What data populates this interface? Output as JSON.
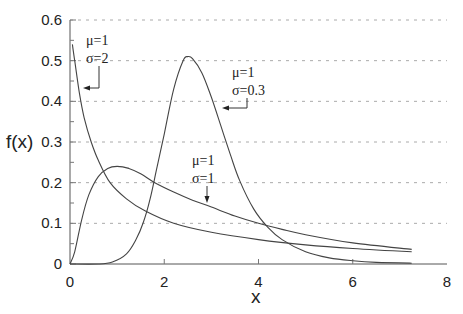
{
  "chart_data": {
    "type": "line",
    "title": "",
    "xlabel": "x",
    "ylabel": "f(x)",
    "xlim": [
      0,
      8
    ],
    "ylim": [
      0,
      0.6
    ],
    "x_ticks": [
      "0",
      "2",
      "4",
      "6",
      "8"
    ],
    "y_ticks": [
      "0",
      "0.1",
      "0.2",
      "0.3",
      "0.4",
      "0.5",
      "0.6"
    ],
    "grid": "horizontal dashed at 0.1 intervals",
    "legend": "none (inline annotations with arrows)",
    "series": [
      {
        "name": "mu=1 sigma=2",
        "annotation": [
          "μ=1",
          "σ=2"
        ],
        "x": [
          0.05,
          0.1,
          0.2,
          0.3,
          0.45,
          0.6,
          0.85,
          1.2,
          1.6,
          2.2,
          3.0,
          4.0,
          5.0,
          6.0,
          7.25
        ],
        "y": [
          0.54,
          0.5,
          0.42,
          0.36,
          0.3,
          0.255,
          0.2,
          0.16,
          0.13,
          0.1,
          0.078,
          0.06,
          0.047,
          0.038,
          0.03
        ]
      },
      {
        "name": "mu=1 sigma=1",
        "annotation": [
          "μ=1",
          "σ=1"
        ],
        "x": [
          0,
          0.1,
          0.25,
          0.4,
          0.6,
          0.8,
          1.0,
          1.25,
          1.5,
          1.8,
          2.2,
          2.6,
          3.0,
          3.5,
          4.0,
          4.5,
          5.0,
          6.0,
          7.25
        ],
        "y": [
          0,
          0.03,
          0.11,
          0.17,
          0.215,
          0.235,
          0.24,
          0.235,
          0.222,
          0.2,
          0.177,
          0.157,
          0.14,
          0.118,
          0.1,
          0.085,
          0.072,
          0.052,
          0.036
        ]
      },
      {
        "name": "mu=1 sigma=0.3",
        "annotation": [
          "μ=1",
          "σ=0.3"
        ],
        "x": [
          0,
          0.6,
          0.9,
          1.2,
          1.4,
          1.55,
          1.7,
          1.85,
          2.0,
          2.2,
          2.4,
          2.5,
          2.6,
          2.8,
          3.0,
          3.2,
          3.4,
          3.6,
          3.9,
          4.2,
          4.5,
          5.0,
          5.5,
          6.0,
          6.5,
          7.25
        ],
        "y": [
          0,
          0,
          0.005,
          0.025,
          0.06,
          0.1,
          0.16,
          0.24,
          0.32,
          0.43,
          0.5,
          0.51,
          0.505,
          0.47,
          0.41,
          0.34,
          0.27,
          0.205,
          0.135,
          0.09,
          0.06,
          0.03,
          0.015,
          0.008,
          0.004,
          0.002
        ]
      }
    ]
  },
  "labels": {
    "ylabel": "f(x)",
    "xlabel": "x",
    "ann_sigma2_mu": "μ=1",
    "ann_sigma2_sigma": "σ=2",
    "ann_sigma03_mu": "μ=1",
    "ann_sigma03_sigma": "σ=0.3",
    "ann_sigma1_mu": "μ=1",
    "ann_sigma1_sigma": "σ=1"
  }
}
